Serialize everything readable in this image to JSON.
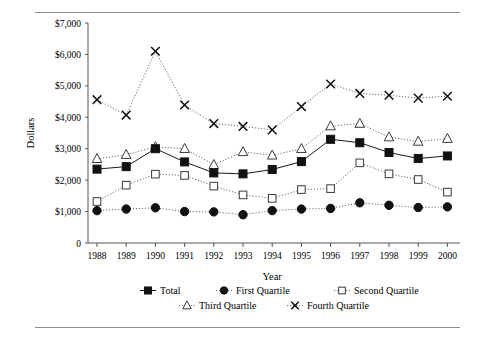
{
  "figure": {
    "rule_top": true,
    "rule_bottom": true
  },
  "axes": {
    "ylabel": "Dollars",
    "xlabel": "Year",
    "y_ticks": [
      "0",
      "$1,000",
      "$2,000",
      "$3,000",
      "$4,000",
      "$5,000",
      "$6,000",
      "$7,000"
    ],
    "x_ticks": [
      "1988",
      "1989",
      "1990",
      "1991",
      "1992",
      "1993",
      "1994",
      "1995",
      "1996",
      "1997",
      "1998",
      "1999",
      "2000"
    ]
  },
  "legend": {
    "position": "bottom",
    "entries": [
      {
        "label": "Total",
        "marker": "filled-square"
      },
      {
        "label": "First Quartile",
        "marker": "filled-circle"
      },
      {
        "label": "Second Quartile",
        "marker": "open-square"
      },
      {
        "label": "Third Quartile",
        "marker": "open-triangle"
      },
      {
        "label": "Fourth Quartile",
        "marker": "cross"
      }
    ]
  },
  "chart_data": {
    "type": "line",
    "title": "",
    "xlabel": "Year",
    "ylabel": "Dollars",
    "x": [
      1988,
      1989,
      1990,
      1991,
      1992,
      1993,
      1994,
      1995,
      1996,
      1997,
      1998,
      1999,
      2000
    ],
    "categories": [
      "1988",
      "1989",
      "1990",
      "1991",
      "1992",
      "1993",
      "1994",
      "1995",
      "1996",
      "1997",
      "1998",
      "1999",
      "2000"
    ],
    "ylim": [
      0,
      7000
    ],
    "ytick_step": 1000,
    "grid": false,
    "series": [
      {
        "name": "Total",
        "marker": "filled-square",
        "linestyle": "solid",
        "values": [
          2350,
          2430,
          3000,
          2580,
          2230,
          2200,
          2340,
          2590,
          3300,
          3190,
          2880,
          2690,
          2770
        ]
      },
      {
        "name": "First Quartile",
        "marker": "filled-circle",
        "linestyle": "dotted",
        "values": [
          1030,
          1080,
          1120,
          1000,
          990,
          900,
          1030,
          1080,
          1100,
          1280,
          1200,
          1130,
          1150
        ]
      },
      {
        "name": "Second Quartile",
        "marker": "open-square",
        "linestyle": "dotted",
        "values": [
          1320,
          1840,
          2190,
          2150,
          1810,
          1530,
          1420,
          1700,
          1730,
          2550,
          2200,
          2020,
          1620
        ]
      },
      {
        "name": "Third Quartile",
        "marker": "open-triangle",
        "linestyle": "dotted",
        "values": [
          2680,
          2810,
          3060,
          3000,
          2490,
          2900,
          2790,
          3000,
          3720,
          3800,
          3370,
          3230,
          3320
        ]
      },
      {
        "name": "Fourth Quartile",
        "marker": "cross",
        "linestyle": "dotted",
        "values": [
          4560,
          4070,
          6100,
          4390,
          3800,
          3710,
          3600,
          4340,
          5060,
          4760,
          4700,
          4610,
          4670
        ]
      }
    ]
  }
}
